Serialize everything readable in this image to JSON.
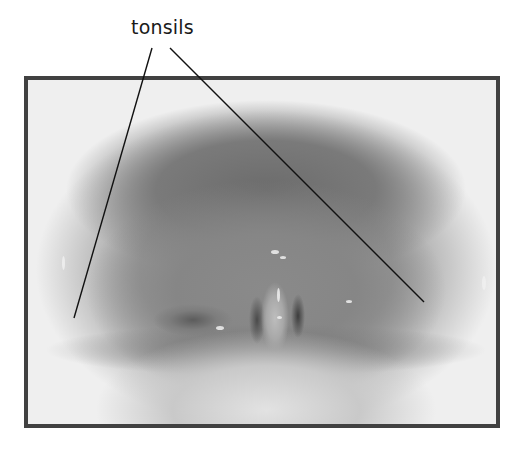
{
  "figure": {
    "style": "grayscale photograph with black border",
    "label": {
      "text": "tonsils",
      "color": "#1a1a1a"
    },
    "leader_lines": [
      {
        "name": "left-tonsil-leader",
        "x1": 152,
        "y1": 48,
        "x2": 74,
        "y2": 318
      },
      {
        "name": "right-tonsil-leader",
        "x1": 170,
        "y1": 48,
        "x2": 424,
        "y2": 302
      }
    ],
    "frame": {
      "border_color": "#414141",
      "x": 24,
      "y": 76,
      "width": 476,
      "height": 352
    }
  }
}
